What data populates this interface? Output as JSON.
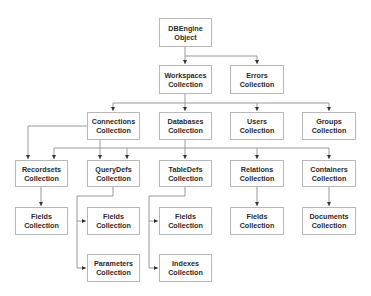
{
  "diagram": {
    "type": "hierarchy",
    "title": "",
    "nodes": {
      "dbengine": {
        "line1": "DBEngine",
        "line2": "Object"
      },
      "workspaces": {
        "line1": "Workspaces",
        "line2": "Collection"
      },
      "errors": {
        "line1": "Errors",
        "line2": "Collection"
      },
      "connections": {
        "line1": "Connections",
        "line2": "Collection"
      },
      "databases": {
        "line1": "Databases",
        "line2": "Collection"
      },
      "users": {
        "line1": "Users",
        "line2": "Collection"
      },
      "groups": {
        "line1": "Groups",
        "line2": "Collection"
      },
      "recordsets": {
        "line1": "Recordsets",
        "line2": "Collection"
      },
      "querydefs": {
        "line1": "QueryDefs",
        "line2": "Collection"
      },
      "tabledefs": {
        "line1": "TableDefs",
        "line2": "Collection"
      },
      "relations": {
        "line1": "Relations",
        "line2": "Collection"
      },
      "containers": {
        "line1": "Containers",
        "line2": "Collection"
      },
      "recordsets_fields": {
        "line1": "Fields",
        "line2": "Collection"
      },
      "querydefs_fields": {
        "line1": "Fields",
        "line2": "Collection"
      },
      "tabledefs_fields": {
        "line1": "Fields",
        "line2": "Collection"
      },
      "relations_fields": {
        "line1": "Fields",
        "line2": "Collection"
      },
      "documents": {
        "line1": "Documents",
        "line2": "Collection"
      },
      "parameters": {
        "line1": "Parameters",
        "line2": "Collection"
      },
      "indexes": {
        "line1": "Indexes",
        "line2": "Collection"
      }
    },
    "edges": [
      [
        "DBEngine Object",
        "Workspaces Collection"
      ],
      [
        "DBEngine Object",
        "Errors Collection"
      ],
      [
        "Workspaces Collection",
        "Connections Collection"
      ],
      [
        "Workspaces Collection",
        "Databases Collection"
      ],
      [
        "Workspaces Collection",
        "Users Collection"
      ],
      [
        "Workspaces Collection",
        "Groups Collection"
      ],
      [
        "Connections Collection",
        "Recordsets Collection"
      ],
      [
        "Connections Collection",
        "QueryDefs Collection"
      ],
      [
        "Databases Collection",
        "Recordsets Collection"
      ],
      [
        "Databases Collection",
        "QueryDefs Collection"
      ],
      [
        "Databases Collection",
        "TableDefs Collection"
      ],
      [
        "Databases Collection",
        "Relations Collection"
      ],
      [
        "Databases Collection",
        "Containers Collection"
      ],
      [
        "Recordsets Collection",
        "Fields Collection"
      ],
      [
        "QueryDefs Collection",
        "Fields Collection"
      ],
      [
        "QueryDefs Collection",
        "Parameters Collection"
      ],
      [
        "TableDefs Collection",
        "Fields Collection"
      ],
      [
        "TableDefs Collection",
        "Indexes Collection"
      ],
      [
        "Relations Collection",
        "Fields Collection"
      ],
      [
        "Containers Collection",
        "Documents Collection"
      ]
    ],
    "colors": {
      "box_border": "#b8b8b8",
      "line": "#9a9a9a",
      "arrow": "#333333",
      "text": "#2a2a2a"
    }
  }
}
